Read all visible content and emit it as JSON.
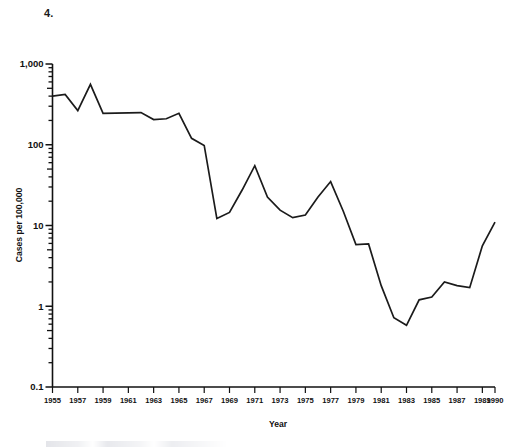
{
  "figure": {
    "number_label": "4."
  },
  "chart_data": {
    "type": "line",
    "title": "",
    "xlabel": "Year",
    "ylabel": "Cases per 100,000",
    "yscale": "log",
    "ylim": [
      0.1,
      1000
    ],
    "xlim": [
      1955,
      1990
    ],
    "grid": false,
    "legend": "none",
    "y_tick_labels": [
      "1,000",
      "100",
      "10",
      "1",
      "0.1"
    ],
    "y_tick_values": [
      1000,
      100,
      10,
      1,
      0.1
    ],
    "x_tick_labels": [
      "1955",
      "1957",
      "1959",
      "1961",
      "1963",
      "1965",
      "1967",
      "1969",
      "1971",
      "1973",
      "1975",
      "1977",
      "1979",
      "1981",
      "1983",
      "1985",
      "1987",
      "1989",
      "1990"
    ],
    "x_tick_values": [
      1955,
      1957,
      1959,
      1961,
      1963,
      1965,
      1967,
      1969,
      1971,
      1973,
      1975,
      1977,
      1979,
      1981,
      1983,
      1985,
      1987,
      1989,
      1990
    ],
    "series": [
      {
        "name": "Cases per 100,000",
        "color": "#1b1b1b",
        "x": [
          1955,
          1956,
          1957,
          1958,
          1959,
          1960,
          1961,
          1962,
          1963,
          1964,
          1965,
          1966,
          1967,
          1968,
          1969,
          1970,
          1971,
          1972,
          1973,
          1974,
          1975,
          1976,
          1977,
          1978,
          1979,
          1980,
          1981,
          1982,
          1983,
          1984,
          1985,
          1986,
          1987,
          1988,
          1989,
          1990
        ],
        "values": [
          400,
          420,
          265,
          560,
          245,
          246,
          248,
          250,
          205,
          210,
          245,
          120,
          98,
          12.2,
          14.5,
          27.5,
          55,
          22.5,
          15.5,
          12.5,
          13.5,
          22.5,
          35,
          15,
          5.8,
          5.9,
          1.8,
          0.72,
          0.58,
          1.2,
          1.3,
          2.0,
          1.8,
          1.7,
          5.6,
          11.0
        ]
      }
    ]
  }
}
